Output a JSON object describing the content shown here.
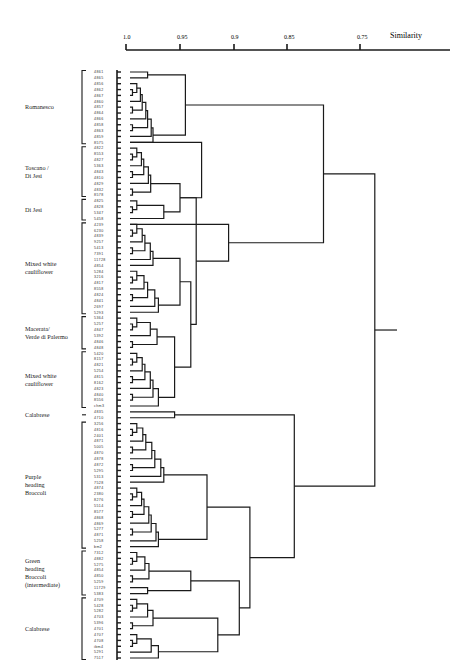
{
  "chart_data": {
    "type": "dendrogram",
    "title": "",
    "xlabel": "Similarity",
    "axis": {
      "ticks": [
        {
          "label": "1.0",
          "value": 1.0
        },
        {
          "label": "0.95",
          "value": 0.95
        },
        {
          "label": "0.9",
          "value": 0.9
        },
        {
          "label": "0.85",
          "value": 0.85
        },
        {
          "label": "0.75",
          "value": 0.75
        }
      ],
      "x_pixel_range": [
        126,
        450
      ],
      "value_range": [
        1.0,
        0.7
      ],
      "grid": false
    },
    "groups": [
      {
        "label": "Romanesco",
        "lines": [
          "Romanesco"
        ],
        "first": 0,
        "last": 12
      },
      {
        "label": "Toscano / Di Jesi",
        "lines": [
          "Toscano /",
          "Di Jesi"
        ],
        "first": 13,
        "last": 21
      },
      {
        "label": "Di Jesi",
        "lines": [
          "Di Jesi"
        ],
        "first": 22,
        "last": 25
      },
      {
        "label": "Mixed white cauliflower",
        "lines": [
          "Mixed white",
          "cauliflower"
        ],
        "first": 26,
        "last": 41
      },
      {
        "label": "Macerata/ Verde di Palermo",
        "lines": [
          "Macerata/",
          "Verde di Palermo"
        ],
        "first": 42,
        "last": 47
      },
      {
        "label": "Mixed white cauliflower",
        "lines": [
          "Mixed white",
          "cauliflower"
        ],
        "first": 48,
        "last": 57
      },
      {
        "label": "Calabrese",
        "lines": [
          "Calabrese"
        ],
        "first": 58,
        "last": 59
      },
      {
        "label": "Purple heading Broccoli",
        "lines": [
          "Purple",
          "heading",
          "Broccoli"
        ],
        "first": 60,
        "last": 81
      },
      {
        "label": "Green heading Broccoli (intermediate)",
        "lines": [
          "Green",
          "heading",
          "Broccoli",
          "(intermediate)"
        ],
        "first": 82,
        "last": 89
      },
      {
        "label": "Calabrese",
        "lines": [
          "Calabrese"
        ],
        "first": 90,
        "last": 100
      }
    ],
    "leaves": [
      "4861",
      "4865",
      "4856",
      "4862",
      "4867",
      "4860",
      "4857",
      "4864",
      "4866",
      "4858",
      "4863",
      "4859",
      "8575",
      "4822",
      "8553",
      "4827",
      "5363",
      "4843",
      "4810",
      "4829",
      "4832",
      "8578",
      "4825",
      "4828",
      "5347",
      "5458",
      "4239",
      "6230",
      "4839",
      "9257",
      "5413",
      "7391",
      "11728",
      "4854",
      "5284",
      "3216",
      "4817",
      "8558",
      "4824",
      "4841",
      "2697",
      "5293",
      "5364",
      "5257",
      "4847",
      "5392",
      "4846",
      "4848",
      "5420",
      "8157",
      "4821",
      "5254",
      "4815",
      "8162",
      "4823",
      "4840",
      "8556",
      "chm3",
      "4835",
      "4710",
      "3256",
      "4816",
      "2401",
      "4871",
      "5005",
      "4870",
      "4878",
      "4872",
      "5295",
      "5313",
      "7528",
      "4874",
      "2380",
      "8276",
      "5514",
      "8577",
      "4868",
      "4869",
      "5277",
      "4871",
      "5258",
      "bm2",
      "7312",
      "4882",
      "5275",
      "4854",
      "4850",
      "5259",
      "11729",
      "5383",
      "4709",
      "5428",
      "5282",
      "4703",
      "5396",
      "4701",
      "4707",
      "4708",
      "ibm4",
      "5291",
      "7517"
    ],
    "major_clusters": [
      {
        "name": "Romanesco",
        "join_similarity": 0.94
      },
      {
        "name": "Cauliflower (Toscano, Di Jesi, Mixed white, Macerata)",
        "join_similarity": 0.88
      },
      {
        "name": "Romanesco + Cauliflower",
        "join_similarity": 0.8
      },
      {
        "name": "Purple heading Broccoli",
        "join_similarity": 0.92
      },
      {
        "name": "Green heading Broccoli + Calabrese",
        "join_similarity": 0.905
      },
      {
        "name": "Broccoli + Calabrese",
        "join_similarity": 0.885
      },
      {
        "name": "Calabrese (4835, 4710) + Broccoli",
        "join_similarity": 0.85
      },
      {
        "name": "Root: Cauliflower vs Broccoli/Calabrese",
        "join_similarity": 0.73
      }
    ]
  }
}
